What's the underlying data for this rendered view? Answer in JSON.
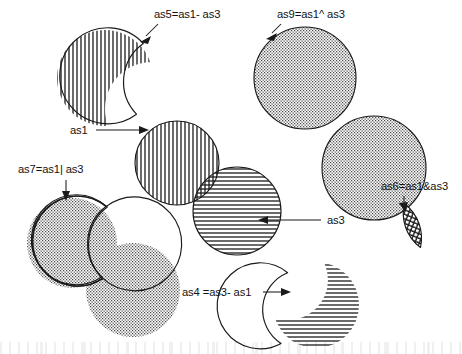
{
  "figure": {
    "background_color": "#ffffff",
    "ink_color": "#1a1a1a",
    "fill_gray": "#8a8a8a"
  },
  "annotations": [
    {
      "id": "as5",
      "text": "as5=as1- as3",
      "operation": "difference",
      "operands": [
        "as1",
        "as3"
      ],
      "x": 154,
      "y": 18,
      "anchor": "start",
      "pointer": "arrow-down-left"
    },
    {
      "id": "as9",
      "text": "as9=as1^ as3",
      "operation": "exclusive-or",
      "operands": [
        "as1",
        "as3"
      ],
      "x": 277,
      "y": 18,
      "anchor": "start",
      "pointer": "arrow-down-left"
    },
    {
      "id": "as1",
      "text": "as1",
      "operation": "operand",
      "operands": [
        "as1"
      ],
      "x": 70,
      "y": 134,
      "anchor": "start",
      "pointer": "leader-right"
    },
    {
      "id": "as7",
      "text": "as7=as1| as3",
      "operation": "union",
      "operands": [
        "as1",
        "as3"
      ],
      "x": 18,
      "y": 173,
      "anchor": "start",
      "pointer": "arrow-down"
    },
    {
      "id": "as6",
      "text": "as6=as1&as3",
      "operation": "intersection",
      "operands": [
        "as1",
        "as3"
      ],
      "x": 381,
      "y": 190,
      "anchor": "start",
      "pointer": "arrow-down"
    },
    {
      "id": "as3",
      "text": "as3",
      "operation": "operand",
      "operands": [
        "as3"
      ],
      "x": 327,
      "y": 224,
      "anchor": "start",
      "pointer": "leader-left"
    },
    {
      "id": "as4",
      "text": "as4 =as3- as1",
      "operation": "difference",
      "operands": [
        "as3",
        "as1"
      ],
      "x": 182,
      "y": 296,
      "anchor": "start",
      "pointer": "arrow-right"
    }
  ],
  "shapes": [
    {
      "id": "as5-shape",
      "label": "as5",
      "fill_pattern": "vertical-hatch",
      "description": "circle minus overlapping circle, bite removed at lower right"
    },
    {
      "id": "as9-shape-left",
      "label": "as9-left-circle",
      "fill_pattern": "stipple-dots",
      "description": "left circle of symmetric difference pair"
    },
    {
      "id": "as9-shape-right",
      "label": "as9-right-circle",
      "fill_pattern": "stipple-dots",
      "description": "right circle of symmetric difference pair, lens left white"
    },
    {
      "id": "as1-shape",
      "label": "as1",
      "fill_pattern": "vertical-hatch",
      "description": "upper-left operand circle"
    },
    {
      "id": "as3-shape",
      "label": "as3",
      "fill_pattern": "horizontal-hatch",
      "description": "lower-right operand circle"
    },
    {
      "id": "as1-as3-overlap",
      "label": "as1 and as3 overlap",
      "fill_pattern": "cross-hatch",
      "description": "lens where the two operand circles overlap"
    },
    {
      "id": "as7-shape",
      "label": "as7",
      "fill_pattern": "stipple-dots",
      "description": "union outline of two circles merged, no internal boundary"
    },
    {
      "id": "as6-shape",
      "label": "as6",
      "fill_pattern": "cross-hatch",
      "description": "tilted lens, intersection only"
    },
    {
      "id": "as4-shape",
      "label": "as4",
      "fill_pattern": "horizontal-hatch",
      "description": "circle minus overlapping circle, bite removed at upper left"
    }
  ]
}
